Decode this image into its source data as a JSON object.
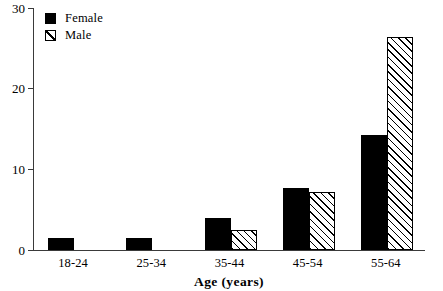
{
  "chart_data": {
    "type": "bar",
    "title": "",
    "xlabel": "Age  (years)",
    "ylabel": "",
    "categories": [
      "18-24",
      "25-34",
      "35-44",
      "45-54",
      "55-64"
    ],
    "series": [
      {
        "name": "Female",
        "values": [
          1.5,
          1.5,
          4.0,
          7.7,
          14.2
        ],
        "color": "#000000",
        "fill": "solid"
      },
      {
        "name": "Male",
        "values": [
          0,
          0,
          2.5,
          7.2,
          26.4
        ],
        "color": "#000000",
        "fill": "diagonal-hatch"
      }
    ],
    "ylim": [
      0,
      30
    ],
    "yticks": [
      0,
      10,
      20,
      30
    ],
    "ytick_labels": [
      "0",
      "10",
      "20",
      "30"
    ],
    "grid": false,
    "legend_position": "top-left"
  },
  "axis": {
    "y_labels": [
      "30",
      "20",
      "10",
      "0"
    ],
    "x_title": "Age  (years)"
  },
  "legend": {
    "items": [
      {
        "label": "Female",
        "swatch": "solid-black-square"
      },
      {
        "label": "Male",
        "swatch": "hatched-square"
      }
    ]
  }
}
